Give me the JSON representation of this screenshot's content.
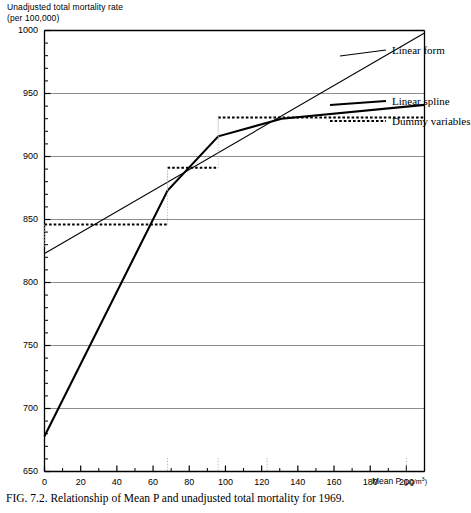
{
  "figure": {
    "caption": "FIG. 7.2. Relationship of Mean P and unadjusted total mortality for 1969.",
    "ylabel_line1": "Unadjusted total mortality rate",
    "ylabel_line2": "(per 100,000)",
    "xlabel": "Mean P",
    "xlabel_unit": "(µg/m",
    "xlabel_unit_sup": "3",
    "xlabel_unit_close": ")"
  },
  "legend": {
    "items": [
      {
        "label": "Linear form",
        "style": "solid-thin"
      },
      {
        "label": "Linear spline",
        "style": "solid-thick"
      },
      {
        "label": "Dummy variables",
        "style": "dotted-thick"
      }
    ]
  },
  "chart_data": {
    "type": "line",
    "title": "Relationship of Mean P and unadjusted total mortality for 1969",
    "xlabel": "Mean P (µg/m3)",
    "ylabel": "Unadjusted total mortality rate (per 100,000)",
    "xlim": [
      0,
      210
    ],
    "ylim": [
      650,
      1000
    ],
    "xticks": [
      0,
      20,
      40,
      60,
      80,
      100,
      120,
      140,
      160,
      180,
      200
    ],
    "yticks": [
      650,
      700,
      750,
      800,
      850,
      900,
      950,
      1000
    ],
    "y_minor_tick_step": 10,
    "x_minor_tick_step": 10,
    "grid": "horizontal-major-only",
    "legend_position": "right-inside",
    "reference_markers_x": [
      68,
      96,
      123,
      200
    ],
    "series": [
      {
        "name": "Linear form",
        "style": "solid-thin",
        "points": [
          [
            0,
            823
          ],
          [
            210,
            998
          ]
        ]
      },
      {
        "name": "Linear spline",
        "style": "solid-thick",
        "points": [
          [
            0,
            678
          ],
          [
            68,
            873
          ],
          [
            96,
            916
          ],
          [
            131,
            930
          ],
          [
            210,
            941
          ]
        ]
      },
      {
        "name": "Dummy variables",
        "style": "dotted-thick",
        "step_levels": [
          {
            "x_from": 0,
            "x_to": 68,
            "y": 846
          },
          {
            "x_from": 68,
            "x_to": 96,
            "y": 891
          },
          {
            "x_from": 96,
            "x_to": 210,
            "y": 931
          }
        ]
      }
    ]
  }
}
